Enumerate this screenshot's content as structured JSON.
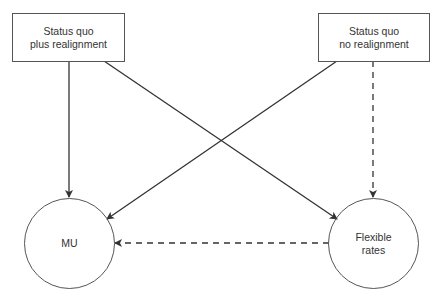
{
  "diagram": {
    "nodes": [
      {
        "id": "sq_plus",
        "shape": "rectangle",
        "lines": [
          "Status quo",
          "plus realignment"
        ]
      },
      {
        "id": "sq_no",
        "shape": "rectangle",
        "lines": [
          "Status quo",
          "no realignment"
        ]
      },
      {
        "id": "mu",
        "shape": "circle",
        "lines": [
          "MU"
        ]
      },
      {
        "id": "flex",
        "shape": "circle",
        "lines": [
          "Flexible",
          "rates"
        ]
      }
    ],
    "edges": [
      {
        "from": "sq_plus",
        "to": "mu",
        "style": "solid"
      },
      {
        "from": "sq_plus",
        "to": "flex",
        "style": "solid"
      },
      {
        "from": "sq_no",
        "to": "mu",
        "style": "solid"
      },
      {
        "from": "sq_no",
        "to": "flex",
        "style": "dashed"
      },
      {
        "from": "flex",
        "to": "mu",
        "style": "dashed"
      }
    ],
    "colors": {
      "stroke": "#333333",
      "background": "#ffffff"
    }
  }
}
